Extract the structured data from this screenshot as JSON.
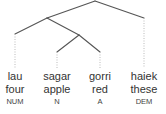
{
  "tree": {
    "nodes": {
      "root": [
        95,
        1
      ],
      "left": [
        47,
        18
      ],
      "inner": [
        79,
        35
      ]
    },
    "branches": [
      {
        "from": "root",
        "to": "left"
      },
      {
        "from": "root",
        "to_leaf": 3
      },
      {
        "from": "left",
        "to_leaf": 0
      },
      {
        "from": "left",
        "to": "inner"
      },
      {
        "from": "inner",
        "to_leaf": 1
      },
      {
        "from": "inner",
        "to_leaf": 2
      }
    ]
  },
  "leaves": [
    {
      "word": "lau",
      "gloss": "four",
      "tag": "NUM",
      "x": 15,
      "branch_end_y": 34
    },
    {
      "word": "sagar",
      "gloss": "apple",
      "tag": "N",
      "x": 57,
      "branch_end_y": 52
    },
    {
      "word": "gorri",
      "gloss": "red",
      "tag": "A",
      "x": 100,
      "branch_end_y": 52
    },
    {
      "word": "haiek",
      "gloss": "these",
      "tag": "DEM",
      "x": 144,
      "branch_end_y": 18
    }
  ],
  "colors": {
    "line": "#555555",
    "dotted": "#bbbbbb",
    "text": "#333333"
  }
}
